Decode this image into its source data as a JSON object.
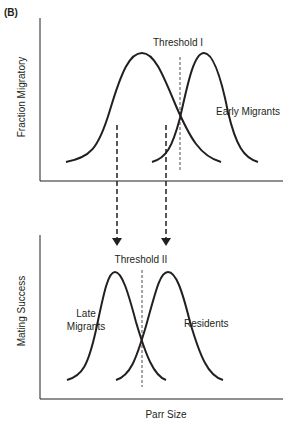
{
  "figure": {
    "panel_label": "(B)",
    "top_panel": {
      "ylabel": "Fraction Migratory",
      "threshold_label": "Threshold I",
      "curve_label": "Early Migrants"
    },
    "bottom_panel": {
      "ylabel": "Mating Success",
      "threshold_label": "Threshold II",
      "curve_label_left_line1": "Late",
      "curve_label_left_line2": "Migrants",
      "curve_label_right": "Residents",
      "xlabel": "Parr Size"
    },
    "colors": {
      "ink": "#231f20",
      "background": "#ffffff"
    }
  }
}
